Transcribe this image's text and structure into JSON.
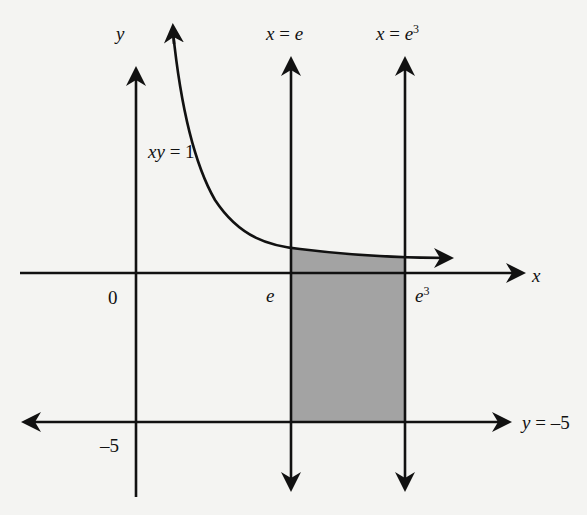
{
  "figure": {
    "type": "region-between-curves diagram",
    "background_color": "#f4f4f2",
    "line_color": "#111111",
    "shade_color": "#9a9a9a"
  },
  "axes": {
    "x_axis_label": "x",
    "y_axis_label": "y",
    "origin_label": "0"
  },
  "curve": {
    "equation_label_lhs": "xy",
    "equation_label_eq": " = ",
    "equation_label_rhs": "1"
  },
  "lines": {
    "left_vertical": {
      "label_var": "x",
      "label_eq": " = ",
      "label_val": "e"
    },
    "right_vertical": {
      "label_var": "x",
      "label_eq": " = ",
      "label_val": "e",
      "label_exp": "3"
    },
    "horizontal": {
      "label_var": "y",
      "label_eq": " = ",
      "label_val": "–5"
    }
  },
  "tick_labels": {
    "x_e": "e",
    "x_e3_base": "e",
    "x_e3_exp": "3",
    "y_minus5": "–5"
  },
  "shaded_region": {
    "description": "Region bounded by xy = 1 above, y = –5 below, x = e left, x = e^3 right"
  }
}
